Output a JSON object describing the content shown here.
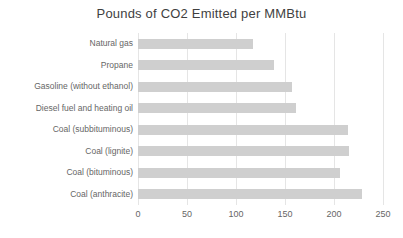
{
  "chart_data": {
    "type": "bar",
    "orientation": "horizontal",
    "title": "Pounds of CO2 Emitted per MMBtu",
    "categories": [
      "Natural gas",
      "Propane",
      "Gasoline (without ethanol)",
      "Diesel fuel and heating oil",
      "Coal (subbituminous)",
      "Coal (lignite)",
      "Coal (bituminous)",
      "Coal (anthracite)"
    ],
    "values": [
      117.0,
      139.0,
      157.2,
      161.3,
      214.3,
      215.4,
      205.7,
      228.6
    ],
    "xlabel": "",
    "ylabel": "",
    "xlim": [
      0,
      250
    ],
    "x_ticks": [
      0,
      50,
      100,
      150,
      200,
      250
    ],
    "grid": "vertical-only",
    "legend": "none",
    "colors": {
      "bar": "#cfcfcf",
      "gridline": "#e5e5e5",
      "title_text": "#3f3f3f",
      "axis_text": "#666666",
      "background": "#ffffff"
    }
  }
}
